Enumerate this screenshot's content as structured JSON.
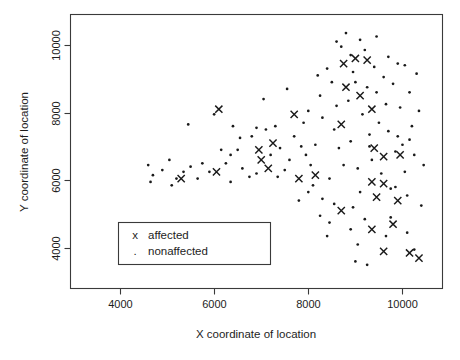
{
  "chart_data": {
    "type": "scatter",
    "title": "",
    "xlabel": "X coordinate of location",
    "ylabel": "Y coordinate of location",
    "xlim": [
      2950,
      10850
    ],
    "ylim": [
      2800,
      10900
    ],
    "xticks": [
      4000,
      6000,
      8000,
      10000
    ],
    "yticks": [
      4000,
      6000,
      8000,
      10000
    ],
    "xtick_labels": [
      "4000",
      "6000",
      "8000",
      "10000"
    ],
    "ytick_labels": [
      "4000",
      "6000",
      "8000",
      "10000"
    ],
    "grid": false,
    "frame": true,
    "legend": {
      "position": "lower-left-inside",
      "entries": [
        {
          "marker": "x",
          "marker_glyph": "x",
          "label": "affected"
        },
        {
          "marker": ".",
          "marker_glyph": ".",
          "label": "nonaffected"
        }
      ]
    },
    "series": [
      {
        "name": "affected",
        "marker": "x",
        "color": "#1a1a1a",
        "points": [
          [
            6100,
            8100
          ],
          [
            5300,
            6050
          ],
          [
            6050,
            6250
          ],
          [
            6950,
            6900
          ],
          [
            7150,
            6350
          ],
          [
            7250,
            7100
          ],
          [
            7000,
            6600
          ],
          [
            7700,
            7950
          ],
          [
            7800,
            6050
          ],
          [
            8150,
            6150
          ],
          [
            8750,
            9450
          ],
          [
            9000,
            9600
          ],
          [
            9250,
            9550
          ],
          [
            9100,
            8500
          ],
          [
            8800,
            8750
          ],
          [
            9350,
            8100
          ],
          [
            8700,
            7650
          ],
          [
            9400,
            6950
          ],
          [
            9600,
            6700
          ],
          [
            9950,
            6750
          ],
          [
            9350,
            5950
          ],
          [
            9600,
            5900
          ],
          [
            9450,
            5500
          ],
          [
            9900,
            5400
          ],
          [
            9350,
            4550
          ],
          [
            9800,
            4700
          ],
          [
            9600,
            3900
          ],
          [
            10150,
            3850
          ],
          [
            10350,
            3700
          ],
          [
            8700,
            5100
          ]
        ]
      },
      {
        "name": "nonaffected",
        "marker": ".",
        "color": "#1a1a1a",
        "points": [
          [
            4600,
            6450
          ],
          [
            4700,
            6150
          ],
          [
            4650,
            5950
          ],
          [
            5050,
            6600
          ],
          [
            5100,
            5850
          ],
          [
            5200,
            6050
          ],
          [
            5450,
            7650
          ],
          [
            5500,
            6400
          ],
          [
            5750,
            6500
          ],
          [
            6000,
            7950
          ],
          [
            6250,
            6500
          ],
          [
            6350,
            5950
          ],
          [
            6400,
            7600
          ],
          [
            6500,
            6900
          ],
          [
            6550,
            7250
          ],
          [
            6600,
            6350
          ],
          [
            6800,
            7300
          ],
          [
            6900,
            7550
          ],
          [
            7050,
            8400
          ],
          [
            7100,
            7500
          ],
          [
            7300,
            7600
          ],
          [
            7400,
            6950
          ],
          [
            7500,
            6300
          ],
          [
            7550,
            8700
          ],
          [
            7700,
            7300
          ],
          [
            7850,
            7000
          ],
          [
            7900,
            7700
          ],
          [
            8000,
            8050
          ],
          [
            8050,
            6450
          ],
          [
            8200,
            9100
          ],
          [
            8250,
            8500
          ],
          [
            8300,
            7850
          ],
          [
            8400,
            9300
          ],
          [
            8500,
            8900
          ],
          [
            8550,
            7500
          ],
          [
            8600,
            8200
          ],
          [
            8650,
            6950
          ],
          [
            8700,
            9950
          ],
          [
            8800,
            10350
          ],
          [
            8850,
            8350
          ],
          [
            8900,
            7150
          ],
          [
            8950,
            9200
          ],
          [
            9000,
            8900
          ],
          [
            9050,
            6350
          ],
          [
            9100,
            10150
          ],
          [
            9150,
            7950
          ],
          [
            9200,
            9850
          ],
          [
            9250,
            8750
          ],
          [
            9300,
            7350
          ],
          [
            9350,
            6600
          ],
          [
            9400,
            9350
          ],
          [
            9450,
            8600
          ],
          [
            9500,
            7700
          ],
          [
            9550,
            6200
          ],
          [
            9600,
            9050
          ],
          [
            9650,
            8250
          ],
          [
            9700,
            7450
          ],
          [
            9750,
            5750
          ],
          [
            9800,
            8850
          ],
          [
            9850,
            6850
          ],
          [
            9900,
            9450
          ],
          [
            9950,
            8150
          ],
          [
            10000,
            7050
          ],
          [
            10050,
            6250
          ],
          [
            10100,
            5550
          ],
          [
            10150,
            8600
          ],
          [
            10200,
            7600
          ],
          [
            10250,
            6750
          ],
          [
            10300,
            9150
          ],
          [
            10350,
            8050
          ],
          [
            10400,
            5250
          ],
          [
            10450,
            6450
          ],
          [
            8100,
            5850
          ],
          [
            8300,
            5450
          ],
          [
            8250,
            4950
          ],
          [
            8450,
            4750
          ],
          [
            8550,
            5300
          ],
          [
            8400,
            4350
          ],
          [
            8900,
            4550
          ],
          [
            8950,
            5200
          ],
          [
            9050,
            4100
          ],
          [
            9200,
            4850
          ],
          [
            9100,
            5650
          ],
          [
            9650,
            4350
          ],
          [
            9750,
            4900
          ],
          [
            9850,
            5800
          ],
          [
            10100,
            4450
          ],
          [
            10250,
            3950
          ],
          [
            8750,
            6450
          ],
          [
            8150,
            7050
          ],
          [
            7950,
            6750
          ],
          [
            7600,
            6600
          ],
          [
            7350,
            6100
          ],
          [
            7200,
            6750
          ],
          [
            6750,
            6100
          ],
          [
            6900,
            6200
          ],
          [
            6350,
            6750
          ],
          [
            6150,
            6900
          ],
          [
            5900,
            6250
          ],
          [
            5650,
            6050
          ],
          [
            5350,
            6250
          ],
          [
            4900,
            6300
          ],
          [
            9450,
            10250
          ],
          [
            8900,
            9700
          ],
          [
            9700,
            9650
          ],
          [
            10050,
            9400
          ],
          [
            8600,
            10100
          ],
          [
            9300,
            7000
          ],
          [
            9900,
            7300
          ],
          [
            10150,
            7200
          ],
          [
            8450,
            6050
          ],
          [
            8000,
            5650
          ],
          [
            7800,
            5400
          ],
          [
            9000,
            3600
          ],
          [
            9250,
            3500
          ]
        ]
      }
    ]
  }
}
